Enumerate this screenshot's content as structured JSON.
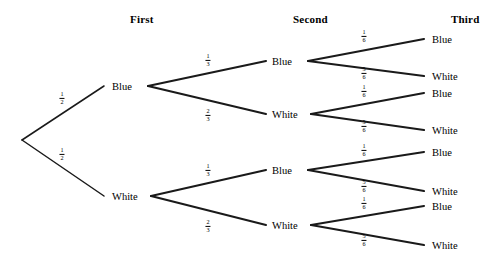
{
  "diagram": {
    "type": "probability-tree",
    "stages": 3,
    "outcomes_per_stage": 2,
    "ink_color": "#1a1a1a",
    "background_color": "#ffffff"
  },
  "headers": [
    {
      "label": "First",
      "x": 130,
      "y": 13
    },
    {
      "label": "Second",
      "x": 293,
      "y": 13
    },
    {
      "label": "Third",
      "x": 451,
      "y": 13
    }
  ],
  "root": {
    "x": 22,
    "y": 140
  },
  "stage1": {
    "nodes": [
      {
        "label": "Blue",
        "lx": 112,
        "ly": 86,
        "vx": 148,
        "vy": 86
      },
      {
        "label": "White",
        "lx": 112,
        "ly": 196,
        "vx": 151,
        "vy": 196
      }
    ],
    "probabilities": [
      {
        "num": "1",
        "den": "2",
        "x": 62,
        "y": 98
      },
      {
        "num": "1",
        "den": "2",
        "x": 62,
        "y": 154
      }
    ]
  },
  "stage2": {
    "nodes": [
      {
        "label": "Blue",
        "lx": 272,
        "ly": 61,
        "vx": 308,
        "vy": 61
      },
      {
        "label": "White",
        "lx": 272,
        "ly": 114,
        "vx": 311,
        "vy": 114
      },
      {
        "label": "Blue",
        "lx": 272,
        "ly": 170,
        "vx": 308,
        "vy": 170
      },
      {
        "label": "White",
        "lx": 272,
        "ly": 225,
        "vx": 311,
        "vy": 225
      }
    ],
    "probabilities": [
      {
        "num": "1",
        "den": "3",
        "x": 208,
        "y": 60
      },
      {
        "num": "2",
        "den": "3",
        "x": 208,
        "y": 115
      },
      {
        "num": "1",
        "den": "3",
        "x": 208,
        "y": 170
      },
      {
        "num": "2",
        "den": "3",
        "x": 208,
        "y": 226
      }
    ]
  },
  "stage3": {
    "nodes": [
      {
        "label": "Blue",
        "lx": 432,
        "ly": 39
      },
      {
        "label": "White",
        "lx": 432,
        "ly": 76
      },
      {
        "label": "Blue",
        "lx": 432,
        "ly": 93
      },
      {
        "label": "White",
        "lx": 432,
        "ly": 130
      },
      {
        "label": "Blue",
        "lx": 432,
        "ly": 152
      },
      {
        "label": "White",
        "lx": 432,
        "ly": 191
      },
      {
        "label": "Blue",
        "lx": 432,
        "ly": 206
      },
      {
        "label": "White",
        "lx": 432,
        "ly": 245
      }
    ],
    "probabilities": [
      {
        "num": "1",
        "den": "6",
        "x": 364,
        "y": 36
      },
      {
        "num": "5",
        "den": "6",
        "x": 364,
        "y": 73
      },
      {
        "num": "1",
        "den": "6",
        "x": 364,
        "y": 91
      },
      {
        "num": "5",
        "den": "6",
        "x": 364,
        "y": 126
      },
      {
        "num": "1",
        "den": "6",
        "x": 364,
        "y": 150
      },
      {
        "num": "5",
        "den": "6",
        "x": 364,
        "y": 186
      },
      {
        "num": "1",
        "den": "6",
        "x": 364,
        "y": 203
      },
      {
        "num": "5",
        "den": "6",
        "x": 364,
        "y": 240
      }
    ]
  },
  "branches": {
    "stage1": [
      {
        "x1": 22,
        "y1": 140,
        "x2": 104,
        "y2": 86
      },
      {
        "x1": 22,
        "y1": 140,
        "x2": 104,
        "y2": 196
      }
    ],
    "stage2": [
      {
        "x1": 148,
        "y1": 86,
        "x2": 266,
        "y2": 61
      },
      {
        "x1": 148,
        "y1": 86,
        "x2": 266,
        "y2": 114
      },
      {
        "x1": 151,
        "y1": 196,
        "x2": 266,
        "y2": 170
      },
      {
        "x1": 151,
        "y1": 196,
        "x2": 266,
        "y2": 225
      }
    ],
    "stage3": [
      {
        "x1": 308,
        "y1": 61,
        "x2": 424,
        "y2": 39
      },
      {
        "x1": 308,
        "y1": 61,
        "x2": 424,
        "y2": 76
      },
      {
        "x1": 311,
        "y1": 114,
        "x2": 424,
        "y2": 93
      },
      {
        "x1": 311,
        "y1": 114,
        "x2": 424,
        "y2": 130
      },
      {
        "x1": 308,
        "y1": 170,
        "x2": 424,
        "y2": 152
      },
      {
        "x1": 308,
        "y1": 170,
        "x2": 424,
        "y2": 191
      },
      {
        "x1": 311,
        "y1": 225,
        "x2": 424,
        "y2": 206
      },
      {
        "x1": 311,
        "y1": 225,
        "x2": 424,
        "y2": 245
      }
    ]
  }
}
